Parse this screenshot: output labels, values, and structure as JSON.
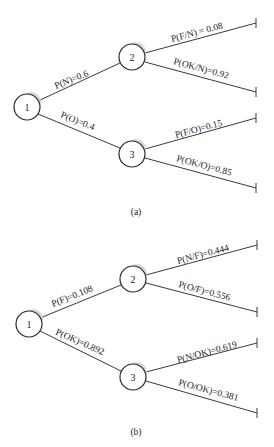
{
  "diagrams": [
    {
      "id": "a",
      "caption": "(a)",
      "nodes": [
        {
          "label": "1",
          "cx": 27,
          "cy": 107
        },
        {
          "label": "2",
          "cx": 132,
          "cy": 57
        },
        {
          "label": "3",
          "cx": 132,
          "cy": 154
        }
      ],
      "edges": [
        {
          "label": "P(N)=0.6",
          "from": 0,
          "to": 1
        },
        {
          "label": "P(O)=0.4",
          "from": 0,
          "to": 2
        },
        {
          "label": "P(F/N) = 0.08",
          "from": 1,
          "end_y": 23
        },
        {
          "label": "P(OK/N)=0.92",
          "from": 1,
          "end_y": 92
        },
        {
          "label": "P(F/O)=0.15",
          "from": 2,
          "end_y": 118
        },
        {
          "label": "P(OK/O)=0.85",
          "from": 2,
          "end_y": 188
        }
      ]
    },
    {
      "id": "b",
      "caption": "(b)",
      "nodes": [
        {
          "label": "1",
          "cx": 29,
          "cy": 324
        },
        {
          "label": "2",
          "cx": 133,
          "cy": 279
        },
        {
          "label": "3",
          "cx": 133,
          "cy": 377
        }
      ],
      "edges": [
        {
          "label": "P(F)=0.108",
          "from": 0,
          "to": 1
        },
        {
          "label": "P(OK)=0.892",
          "from": 0,
          "to": 2
        },
        {
          "label": "P(N/F)=0.444",
          "from": 1,
          "end_y": 245
        },
        {
          "label": "P(O/F)=0.556",
          "from": 1,
          "end_y": 312
        },
        {
          "label": "P(N/OK)=0.619",
          "from": 2,
          "end_y": 343
        },
        {
          "label": "P(O/OK)=0.381",
          "from": 2,
          "end_y": 413
        }
      ]
    }
  ]
}
